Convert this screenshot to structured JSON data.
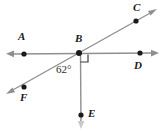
{
  "figure": {
    "background_color": "#ffffff",
    "line_color": "#8f8f8f",
    "point_color": "#1a1a1a",
    "label_color": "#1a1a1a"
  },
  "labels": {
    "A": "A",
    "B": "B",
    "C": "C",
    "D": "D",
    "E": "E",
    "F": "F",
    "angle_ABF": "62°"
  },
  "points": [
    {
      "name": "A",
      "label": "A",
      "x": 24,
      "y": 54
    },
    {
      "name": "B",
      "label": "B",
      "x": 79,
      "y": 53
    },
    {
      "name": "C",
      "label": "C",
      "x": 136,
      "y": 21
    },
    {
      "name": "D",
      "label": "D",
      "x": 140,
      "y": 53
    },
    {
      "name": "E",
      "label": "E",
      "x": 81,
      "y": 115
    },
    {
      "name": "F",
      "label": "F",
      "x": 24,
      "y": 87
    }
  ],
  "lines": [
    {
      "name": "line-AD",
      "description": "horizontal double-headed line through A, B, D",
      "from": {
        "x": 8,
        "y": 54
      },
      "to": {
        "x": 157,
        "y": 53
      },
      "arrows": "both"
    },
    {
      "name": "line-FC",
      "description": "diagonal double-headed line through F, B, C",
      "from": {
        "x": 8,
        "y": 93
      },
      "to": {
        "x": 155,
        "y": 10
      },
      "arrows": "both"
    },
    {
      "name": "ray-BE",
      "description": "vertical ray from B downward through E",
      "from": {
        "x": 80,
        "y": 53
      },
      "to": {
        "x": 81,
        "y": 127
      },
      "arrows": "end"
    }
  ],
  "markers": {
    "right_angle": {
      "name": "right-angle-marker",
      "description": "square marker showing 90 degrees between ray BD and ray BE",
      "vertex": {
        "x": 80,
        "y": 54
      },
      "size": 8
    },
    "angle_arc": {
      "name": "angle-label-62",
      "value": "62°",
      "vertex": "B",
      "between": [
        "BF",
        "BE"
      ]
    }
  }
}
